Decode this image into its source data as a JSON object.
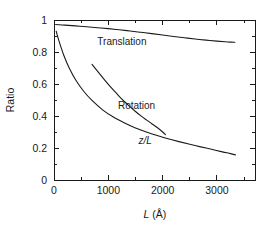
{
  "chart_data": {
    "type": "line",
    "title": "",
    "xlabel": "L (Å)",
    "xlabel_symbol": "L",
    "xlabel_unit": "(Å)",
    "ylabel": "Ratio",
    "xlim": [
      0,
      3700
    ],
    "ylim": [
      0,
      1
    ],
    "grid": false,
    "legend_position": "inline-annotations",
    "xticks": [
      0,
      1000,
      2000,
      3000
    ],
    "xtick_labels": [
      "0",
      "1000",
      "2000",
      "3000"
    ],
    "xminor_ticks": [
      500,
      1500,
      2500,
      3500
    ],
    "yticks": [
      0,
      0.2,
      0.4,
      0.6,
      0.8,
      1
    ],
    "ytick_labels": [
      "0",
      "0.2",
      "0.4",
      "0.6",
      "0.8",
      "1"
    ],
    "yminor_ticks": [
      0.1,
      0.3,
      0.5,
      0.7,
      0.9
    ],
    "series": [
      {
        "name": "Translation",
        "label": "Translation",
        "label_style": "normal",
        "color": "#1a1a1a",
        "x": [
          30,
          200,
          400,
          600,
          800,
          1000,
          1200,
          1400,
          1600,
          1800,
          2000,
          2200,
          2400,
          2600,
          2800,
          3000,
          3150,
          3250,
          3330
        ],
        "y": [
          0.972,
          0.968,
          0.963,
          0.958,
          0.952,
          0.946,
          0.939,
          0.931,
          0.923,
          0.915,
          0.906,
          0.897,
          0.889,
          0.881,
          0.874,
          0.868,
          0.864,
          0.862,
          0.861
        ]
      },
      {
        "name": "Rotation",
        "label": "Rotation",
        "label_style": "normal",
        "color": "#1a1a1a",
        "x": [
          700,
          800,
          900,
          1000,
          1100,
          1200,
          1300,
          1400,
          1500,
          1600,
          1700,
          1800,
          1900,
          2000,
          2050
        ],
        "y": [
          0.723,
          0.68,
          0.638,
          0.598,
          0.56,
          0.523,
          0.489,
          0.458,
          0.428,
          0.401,
          0.376,
          0.352,
          0.328,
          0.3,
          0.283
        ]
      },
      {
        "name": "z/L",
        "label": "z/L",
        "label_style": "italic",
        "color": "#1a1a1a",
        "x": [
          40,
          100,
          180,
          280,
          400,
          550,
          700,
          900,
          1100,
          1300,
          1500,
          1700,
          1900,
          2100,
          2300,
          2500,
          2700,
          2900,
          3100,
          3250,
          3340
        ],
        "y": [
          0.93,
          0.86,
          0.78,
          0.7,
          0.625,
          0.553,
          0.497,
          0.437,
          0.392,
          0.356,
          0.325,
          0.3,
          0.278,
          0.258,
          0.24,
          0.223,
          0.207,
          0.192,
          0.176,
          0.165,
          0.157
        ]
      }
    ],
    "annotations": [
      {
        "text": "Translation",
        "x": 1250,
        "y": 0.845,
        "style": "normal"
      },
      {
        "text": "Rotation",
        "x": 1520,
        "y": 0.445,
        "style": "normal"
      },
      {
        "text": "z/L",
        "x": 1680,
        "y": 0.225,
        "style": "italic"
      }
    ]
  }
}
